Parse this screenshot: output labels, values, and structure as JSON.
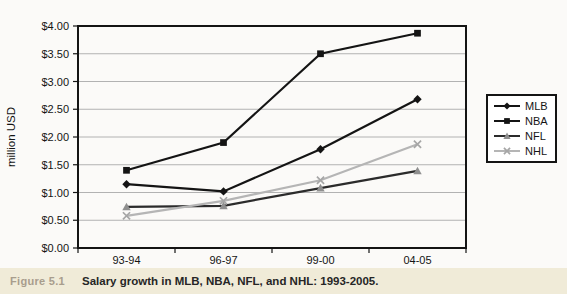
{
  "figure": {
    "label": "Figure 5.1",
    "caption": "Salary growth in MLB, NBA, NFL, and NHL: 1993-2005."
  },
  "chart_data": {
    "type": "line",
    "title": "",
    "xlabel": "",
    "ylabel": "million USD",
    "categories": [
      "93-94",
      "96-97",
      "99-00",
      "04-05"
    ],
    "series": [
      {
        "name": "MLB",
        "marker": "diamond",
        "line_color": "#141414",
        "marker_color": "#141414",
        "values": [
          1.15,
          1.02,
          1.78,
          2.68
        ]
      },
      {
        "name": "NBA",
        "marker": "square",
        "line_color": "#141414",
        "marker_color": "#141414",
        "values": [
          1.4,
          1.9,
          3.5,
          3.87
        ]
      },
      {
        "name": "NFL",
        "marker": "triangle",
        "line_color": "#2b2b2b",
        "marker_color": "#8f8f8f",
        "values": [
          0.74,
          0.76,
          1.08,
          1.39
        ]
      },
      {
        "name": "NHL",
        "marker": "x",
        "line_color": "#b5b5b5",
        "marker_color": "#a6a6a6",
        "values": [
          0.58,
          0.85,
          1.22,
          1.87
        ]
      }
    ],
    "ylim": [
      0,
      4
    ],
    "ytick_step": 0.5,
    "ytick_labels": [
      "$0.00",
      "$0.50",
      "$1.00",
      "$1.50",
      "$2.00",
      "$2.50",
      "$3.00",
      "$3.50",
      "$4.00"
    ],
    "grid": true,
    "legend_position": "right",
    "legend_entries": [
      "MLB",
      "NBA",
      "NFL",
      "NHL"
    ]
  },
  "colors": {
    "page_bg": "#fbfaf8",
    "plot_bg": "#ffffff",
    "grid": "#b2b2b2",
    "axis": "#141414",
    "tick_text": "#141414",
    "caption_bg": "#f0ebd8",
    "figure_label": "#a89d8d",
    "caption_text": "#262626"
  }
}
